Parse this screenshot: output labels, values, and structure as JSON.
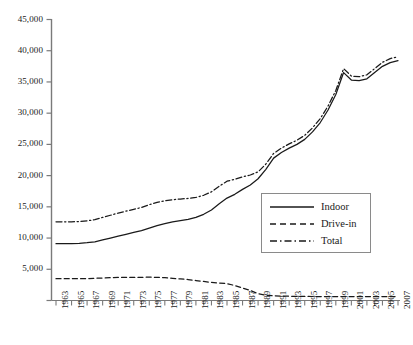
{
  "chart_data": {
    "type": "line",
    "title": "",
    "xlabel": "",
    "ylabel": "",
    "xlim": [
      1963,
      2007
    ],
    "ylim": [
      0,
      45000
    ],
    "ytick_step": 5000,
    "grid": false,
    "legend_position": "inside-lower-right",
    "x": [
      1963,
      1964,
      1965,
      1966,
      1967,
      1968,
      1969,
      1970,
      1971,
      1972,
      1973,
      1974,
      1975,
      1976,
      1977,
      1978,
      1979,
      1980,
      1981,
      1982,
      1983,
      1984,
      1985,
      1986,
      1987,
      1988,
      1989,
      1990,
      1991,
      1992,
      1993,
      1994,
      1995,
      1996,
      1997,
      1998,
      1999,
      2000,
      2001,
      2002,
      2003,
      2004,
      2005,
      2006,
      2007
    ],
    "xtick_labels": [
      "1963",
      "1965",
      "1967",
      "1969",
      "1971",
      "1973",
      "1975",
      "1977",
      "1979",
      "1981",
      "1983",
      "1985",
      "1987",
      "1989",
      "1991",
      "1993",
      "1995",
      "1997",
      "1999",
      "2001",
      "2003",
      "2005",
      "2007"
    ],
    "ytick_labels": [
      "5,000",
      "10,000",
      "15,000",
      "20,000",
      "25,000",
      "30,000",
      "35,000",
      "40,000",
      "45,000"
    ],
    "series": [
      {
        "name": "Indoor",
        "style": "solid",
        "values": [
          9100,
          9100,
          9100,
          9150,
          9250,
          9400,
          9700,
          10000,
          10300,
          10600,
          10900,
          11200,
          11600,
          12000,
          12300,
          12600,
          12800,
          13000,
          13300,
          13800,
          14500,
          15500,
          16400,
          17000,
          17800,
          18500,
          19500,
          21000,
          22800,
          23700,
          24400,
          25000,
          25800,
          27000,
          28500,
          30500,
          33000,
          36500,
          35300,
          35200,
          35500,
          36500,
          37500,
          38100,
          38400
        ]
      },
      {
        "name": "Drive-in",
        "style": "dashed",
        "values": [
          3500,
          3500,
          3500,
          3500,
          3500,
          3550,
          3600,
          3650,
          3700,
          3700,
          3700,
          3700,
          3750,
          3700,
          3650,
          3550,
          3450,
          3350,
          3200,
          3050,
          2900,
          2800,
          2700,
          2400,
          2000,
          1600,
          1100,
          850,
          750,
          700,
          680,
          660,
          650,
          640,
          640,
          640,
          640,
          640,
          640,
          640,
          640,
          640,
          640,
          640,
          640
        ]
      },
      {
        "name": "Total",
        "style": "dashdot",
        "values": [
          12600,
          12600,
          12600,
          12650,
          12750,
          12950,
          13300,
          13650,
          14000,
          14300,
          14600,
          14900,
          15350,
          15700,
          15950,
          16150,
          16250,
          16350,
          16500,
          16850,
          17400,
          18300,
          19100,
          19400,
          19800,
          20100,
          20600,
          21850,
          23550,
          24400,
          25080,
          25660,
          26450,
          27640,
          29140,
          31140,
          33640,
          37140,
          35940,
          35840,
          36140,
          37140,
          38140,
          38740,
          39040
        ]
      }
    ]
  },
  "legend": {
    "items": [
      {
        "label": "Indoor",
        "style": "solid"
      },
      {
        "label": "Drive-in",
        "style": "dashed"
      },
      {
        "label": "Total",
        "style": "dashdot"
      }
    ]
  }
}
